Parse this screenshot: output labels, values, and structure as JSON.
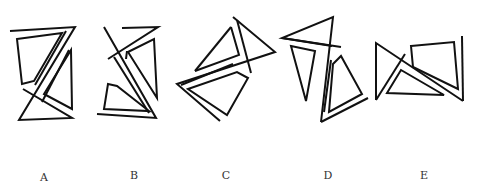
{
  "options": [
    {
      "label": "A",
      "label_x": 44,
      "label_y": 171
    },
    {
      "label": "B",
      "label_x": 134,
      "label_y": 169
    },
    {
      "label": "C",
      "label_x": 226,
      "label_y": 169
    },
    {
      "label": "D",
      "label_x": 328,
      "label_y": 169
    },
    {
      "label": "E",
      "label_x": 424,
      "label_y": 169
    }
  ],
  "stroke_color": "#111111",
  "background_color": "#ffffff"
}
